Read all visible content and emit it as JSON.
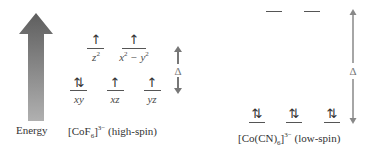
{
  "energy_axis": {
    "label": "Energy",
    "icon": "energy-gradient-arrow",
    "colors": {
      "top": "#5e5e5e",
      "bottom": "#a8a8a8"
    }
  },
  "high_spin": {
    "complex_prefix": "[CoF",
    "complex_sub": "6",
    "complex_bracket": "]",
    "complex_sup": "3−",
    "spin_label": " (high-spin)",
    "eg": [
      {
        "orbital": "z",
        "orbital_sup": "2",
        "electrons": "↑"
      },
      {
        "orbital": "x",
        "orbital_sup": "2",
        "orbital_rest": " − y",
        "orbital_sup2": "2",
        "electrons": "↑"
      }
    ],
    "t2g": [
      {
        "orbital": "xy",
        "electrons": "⇅"
      },
      {
        "orbital": "xz",
        "electrons": "↑"
      },
      {
        "orbital": "yz",
        "electrons": "↑"
      }
    ],
    "splitting_label": "Δ"
  },
  "low_spin": {
    "complex_prefix": "[Co(CN)",
    "complex_sub": "6",
    "complex_bracket": "]",
    "complex_sup": "3−",
    "spin_label": " (low-spin)",
    "eg": [
      {
        "electrons": ""
      },
      {
        "electrons": ""
      }
    ],
    "t2g": [
      {
        "electrons": "⇅"
      },
      {
        "electrons": "⇅"
      },
      {
        "electrons": "⇅"
      }
    ],
    "splitting_label": "Δ"
  }
}
